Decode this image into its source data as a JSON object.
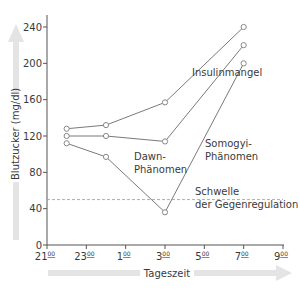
{
  "chart_data": {
    "type": "line",
    "title": "",
    "xlabel": "Tageszeit",
    "ylabel": "Blutzucker (mg/dl)",
    "x_ticks": [
      "21",
      "23",
      "1",
      "3",
      "5",
      "7",
      "9"
    ],
    "x_tick_superscript": "00",
    "y_ticks": [
      0,
      40,
      80,
      120,
      160,
      200,
      240
    ],
    "ylim": [
      0,
      250
    ],
    "x_hours": [
      21,
      23,
      25,
      27,
      29,
      31,
      33
    ],
    "grid": false,
    "legend": "inline annotations",
    "series": [
      {
        "name": "Insulinmangel",
        "x": [
          22,
          24,
          27,
          31
        ],
        "values": [
          128,
          132,
          157,
          240
        ]
      },
      {
        "name": "Dawn-Phänomen",
        "x": [
          22,
          24,
          27,
          31
        ],
        "values": [
          120,
          120,
          114,
          220
        ]
      },
      {
        "name": "Somogyi-Phänomen",
        "x": [
          22,
          24,
          27,
          31
        ],
        "values": [
          112,
          97,
          36,
          200
        ]
      }
    ],
    "threshold": {
      "value": 50,
      "label_line1": "Schwelle",
      "label_line2": "der Gegenregulation",
      "style": "dashed"
    },
    "annotations": {
      "insulin": "Insulinmangel",
      "dawn_1": "Dawn-",
      "dawn_2": "Phänomen",
      "somogyi_1": "Somogyi-",
      "somogyi_2": "Phänomen"
    }
  }
}
